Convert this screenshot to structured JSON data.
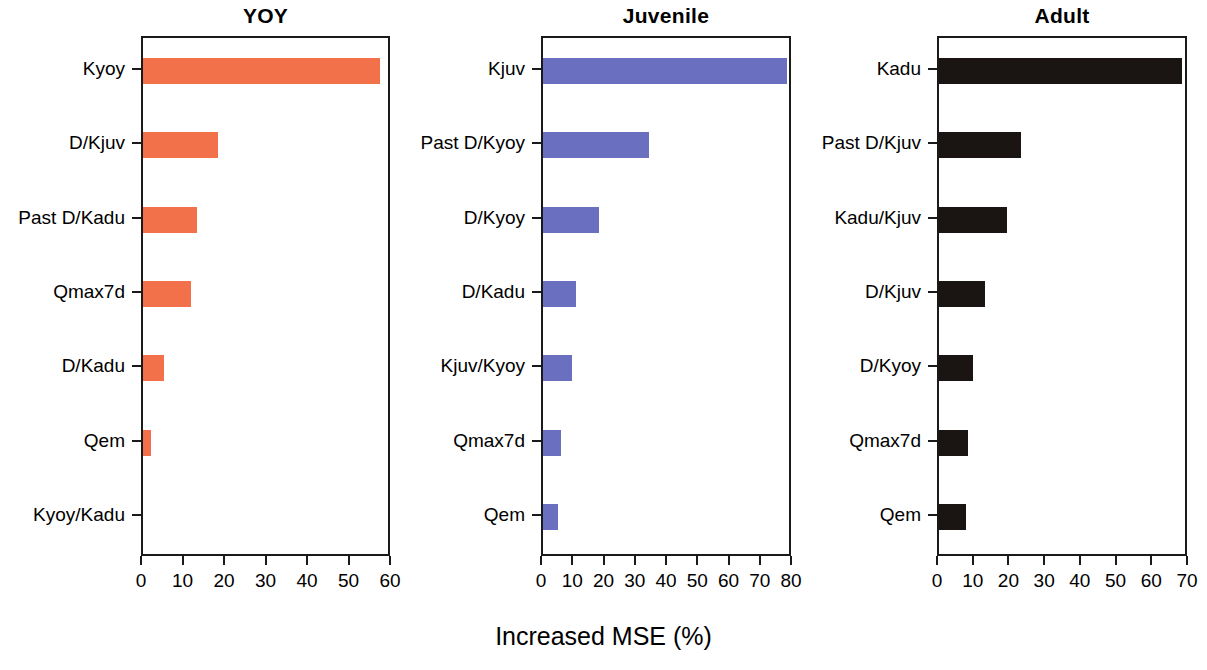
{
  "figure": {
    "axis_label": "Increased MSE (%)",
    "background": "#ffffff"
  },
  "chart_data": {
    "type": "bar",
    "orientation": "horizontal",
    "title": "",
    "xlabel": "Increased MSE (%)",
    "ylabel": "",
    "grid": false,
    "legend": "none",
    "panels": [
      {
        "title": "YOY",
        "color": "#f2704a",
        "xlim": [
          0,
          60
        ],
        "xticks": [
          0,
          10,
          20,
          30,
          40,
          50,
          60
        ],
        "xticklabels": [
          "0",
          "10",
          "20",
          "30",
          "40",
          "50",
          "60"
        ],
        "categories": [
          "Kyoy",
          "D/Kjuv",
          "Past D/Kadu",
          "Qmax7d",
          "D/Kadu",
          "Qem",
          "Kyoy/Kadu"
        ],
        "values": [
          57,
          18,
          13,
          11.5,
          5,
          2,
          0
        ]
      },
      {
        "title": "Juvenile",
        "color": "#6a6fc0",
        "xlim": [
          0,
          80
        ],
        "xticks": [
          0,
          10,
          20,
          30,
          40,
          50,
          60,
          70,
          80
        ],
        "xticklabels": [
          "0",
          "10",
          "20",
          "30",
          "40",
          "50",
          "60",
          "70",
          "80"
        ],
        "categories": [
          "Kjuv",
          "Past D/Kyoy",
          "D/Kyoy",
          "D/Kadu",
          "Kjuv/Kyoy",
          "Qmax7d",
          "Qem"
        ],
        "values": [
          78,
          34,
          18,
          10.5,
          9.3,
          5.8,
          4.8
        ]
      },
      {
        "title": "Adult",
        "color": "#1a1512",
        "xlim": [
          0,
          70
        ],
        "xticks": [
          0,
          10,
          20,
          30,
          40,
          50,
          60,
          70
        ],
        "xticklabels": [
          "0",
          "10",
          "20",
          "30",
          "40",
          "50",
          "60",
          "70"
        ],
        "categories": [
          "Kadu",
          "Past D/Kjuv",
          "Kadu/Kjuv",
          "D/Kjuv",
          "D/Kyoy",
          "Qmax7d",
          "Qem"
        ],
        "values": [
          68,
          23,
          19,
          13,
          9.5,
          8,
          7.5
        ]
      }
    ]
  }
}
